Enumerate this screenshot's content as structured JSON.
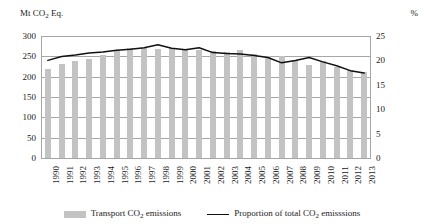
{
  "axes": {
    "left_title": "Mt CO2 Eq.",
    "left_title_main": "Mt CO",
    "left_title_sub": "2",
    "left_title_tail": " Eq.",
    "right_title": "%",
    "left_ticks": [
      "300",
      "250",
      "200",
      "150",
      "100",
      "50",
      "0"
    ],
    "right_ticks": [
      "25",
      "20",
      "15",
      "10",
      "5",
      "0"
    ]
  },
  "legend": {
    "bar_label_main": "Transport CO",
    "bar_label_sub": "2",
    "bar_label_tail": " emissions",
    "line_label_main": "Proportion of total CO",
    "line_label_sub": "2",
    "line_label_tail": " emisssions",
    "bar_color": "#c3c3c3",
    "line_color": "#111111"
  },
  "chart_data": {
    "type": "bar",
    "title": "",
    "subtitle": "",
    "xlabel": "",
    "ylabel": "Mt CO2 Eq.",
    "y2label": "%",
    "ylim": [
      0,
      300
    ],
    "y2lim": [
      0,
      25
    ],
    "ytick_step": 50,
    "y2tick_step": 5,
    "grid": true,
    "legend_position": "bottom",
    "categories": [
      "1990",
      "1991",
      "1992",
      "1993",
      "1994",
      "1995",
      "1996",
      "1997",
      "1998",
      "1999",
      "2000",
      "2001",
      "2002",
      "2003",
      "2004",
      "2005",
      "2006",
      "2007",
      "2008",
      "2009",
      "2010",
      "2011",
      "2012",
      "2013"
    ],
    "series": [
      {
        "name": "Transport CO2 emissions",
        "type": "bar",
        "axis": "left",
        "unit": "Mt CO2 Eq.",
        "color": "#c3c3c3",
        "values": [
          220,
          232,
          239,
          243,
          254,
          266,
          270,
          271,
          269,
          270,
          267,
          265,
          262,
          261,
          265,
          256,
          252,
          251,
          240,
          229,
          238,
          224,
          217,
          211
        ]
      },
      {
        "name": "Proportion of total CO2 emisssions",
        "type": "line",
        "axis": "right",
        "unit": "%",
        "color": "#111111",
        "values": [
          20.0,
          20.8,
          21.1,
          21.5,
          21.7,
          22.1,
          22.3,
          22.6,
          23.2,
          22.5,
          22.2,
          22.6,
          21.6,
          21.4,
          21.3,
          21.0,
          20.6,
          19.5,
          20.0,
          20.6,
          19.7,
          18.9,
          17.9,
          17.4
        ]
      }
    ]
  }
}
